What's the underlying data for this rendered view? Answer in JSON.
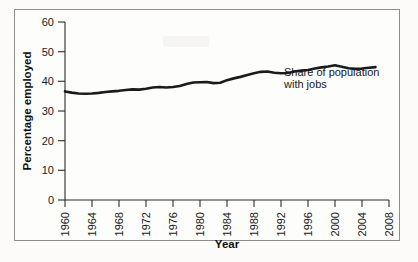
{
  "figure": {
    "background_color": "#fcfbf9",
    "border_color": "#8d8d8d",
    "line_color": "#1b1b1b"
  },
  "chart_data": {
    "type": "line",
    "title": "",
    "xlabel": "Year",
    "ylabel": "Percentage employed",
    "xlim": [
      1960,
      2008
    ],
    "ylim": [
      0,
      60
    ],
    "xticks": [
      "1960",
      "1964",
      "1968",
      "1972",
      "1976",
      "1980",
      "1984",
      "1988",
      "1992",
      "1996",
      "2000",
      "2004",
      "2008"
    ],
    "yticks": [
      "0",
      "10",
      "20",
      "30",
      "40",
      "50",
      "60"
    ],
    "grid": false,
    "legend_position": "inline-annotation",
    "annotations": [
      {
        "text_line_1": "Share of population",
        "text_line_2": "with jobs",
        "x": 1992,
        "y": 43
      }
    ],
    "series": [
      {
        "name": "Share of population with jobs",
        "color": "#1b1b1b",
        "x": [
          1960,
          1961,
          1962,
          1963,
          1964,
          1965,
          1966,
          1967,
          1968,
          1969,
          1970,
          1971,
          1972,
          1973,
          1974,
          1975,
          1976,
          1977,
          1978,
          1979,
          1980,
          1981,
          1982,
          1983,
          1984,
          1985,
          1986,
          1987,
          1988,
          1989,
          1990,
          1991,
          1992,
          1993,
          1994,
          1995,
          1996,
          1997,
          1998,
          1999,
          2000,
          2001,
          2002,
          2003,
          2004,
          2005,
          2006
        ],
        "values": [
          36.6,
          36.2,
          35.9,
          35.8,
          35.9,
          36.1,
          36.4,
          36.6,
          36.8,
          37.1,
          37.3,
          37.2,
          37.5,
          37.9,
          38.1,
          37.9,
          38.1,
          38.4,
          39.1,
          39.6,
          39.7,
          39.8,
          39.4,
          39.5,
          40.4,
          41.0,
          41.5,
          42.1,
          42.7,
          43.2,
          43.3,
          42.9,
          42.7,
          42.8,
          43.3,
          43.6,
          43.8,
          44.3,
          44.7,
          45.0,
          45.4,
          44.9,
          44.4,
          44.2,
          44.3,
          44.6,
          44.8
        ]
      }
    ]
  }
}
